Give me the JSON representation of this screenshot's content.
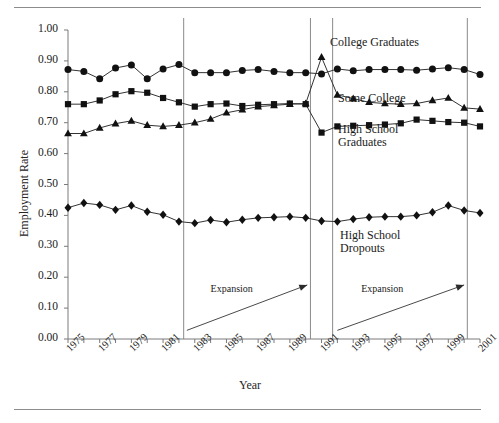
{
  "figure": {
    "has_top_rule": true,
    "has_bottom_rule": true,
    "rule_color": "#8c8c8c"
  },
  "chart_data": {
    "type": "line",
    "title": "",
    "subtitle": "",
    "xlabel": "Year",
    "ylabel": "Employment Rate",
    "xlim": [
      1975,
      2001
    ],
    "ylim": [
      0.0,
      1.0
    ],
    "grid": false,
    "legend_position": "inline-annotations",
    "marker_color": "#111111",
    "line_color": "#333333",
    "ytick_labels": [
      "0.00",
      "0.10",
      "0.20",
      "0.30",
      "0.40",
      "0.50",
      "0.60",
      "0.70",
      "0.80",
      "0.90",
      "1.00"
    ],
    "ytick_values": [
      0.0,
      0.1,
      0.2,
      0.3,
      0.4,
      0.5,
      0.6,
      0.7,
      0.8,
      0.9,
      1.0
    ],
    "xtick_labels": [
      "1975",
      "1977",
      "1979",
      "1981",
      "1983",
      "1985",
      "1987",
      "1989",
      "1991",
      "1993",
      "1995",
      "1997",
      "1999",
      "2001"
    ],
    "xtick_values": [
      1975,
      1977,
      1979,
      1981,
      1983,
      1985,
      1987,
      1989,
      1991,
      1993,
      1995,
      1997,
      1999,
      2001
    ],
    "x": [
      1975,
      1976,
      1977,
      1978,
      1979,
      1980,
      1981,
      1982,
      1983,
      1984,
      1985,
      1986,
      1987,
      1988,
      1989,
      1990,
      1991,
      1992,
      1993,
      1994,
      1995,
      1996,
      1997,
      1998,
      1999,
      2000,
      2001
    ],
    "series": [
      {
        "name": "College Graduates",
        "marker": "circle",
        "label_position": "top-right",
        "values": [
          0.872,
          0.866,
          0.842,
          0.877,
          0.887,
          0.842,
          0.874,
          0.888,
          0.862,
          0.862,
          0.862,
          0.869,
          0.872,
          0.866,
          0.862,
          0.862,
          0.858,
          0.874,
          0.868,
          0.872,
          0.872,
          0.872,
          0.87,
          0.874,
          0.878,
          0.872,
          0.856
        ]
      },
      {
        "name": "Some College",
        "marker": "triangle",
        "label_position": "middle-right",
        "values": [
          0.665,
          0.665,
          0.683,
          0.697,
          0.706,
          0.692,
          0.688,
          0.692,
          0.7,
          0.712,
          0.732,
          0.742,
          0.752,
          0.756,
          0.76,
          0.762,
          0.912,
          0.79,
          0.778,
          0.766,
          0.762,
          0.76,
          0.762,
          0.772,
          0.78,
          0.748,
          0.744
        ]
      },
      {
        "name": "High School Graduates",
        "marker": "square",
        "label_position": "lower-right",
        "values": [
          0.76,
          0.76,
          0.772,
          0.792,
          0.802,
          0.797,
          0.78,
          0.766,
          0.752,
          0.76,
          0.762,
          0.754,
          0.758,
          0.76,
          0.762,
          0.76,
          0.668,
          0.688,
          0.69,
          0.692,
          0.694,
          0.698,
          0.71,
          0.706,
          0.702,
          0.7,
          0.688
        ]
      },
      {
        "name": "High School Dropouts",
        "marker": "diamond",
        "label_position": "bottom-right",
        "values": [
          0.425,
          0.44,
          0.434,
          0.418,
          0.432,
          0.412,
          0.402,
          0.38,
          0.375,
          0.385,
          0.378,
          0.386,
          0.392,
          0.394,
          0.396,
          0.392,
          0.382,
          0.38,
          0.388,
          0.394,
          0.396,
          0.396,
          0.4,
          0.41,
          0.432,
          0.416,
          0.408
        ]
      }
    ],
    "vertical_lines": [
      {
        "year": 1982.3,
        "label": "recession-divider-1"
      },
      {
        "year": 1990.3,
        "label": "recession-divider-2"
      },
      {
        "year": 1991.7,
        "label": "recession-divider-3"
      },
      {
        "year": 2000.2,
        "label": "recession-divider-4"
      }
    ],
    "annotations": [
      {
        "text": "Expansion",
        "arrow_from": {
          "year": 1982.5,
          "value": 0.028
        },
        "arrow_to": {
          "year": 1990.1,
          "value": 0.175
        },
        "text_at": {
          "year": 1984.0,
          "value": 0.16
        }
      },
      {
        "text": "Expansion",
        "arrow_from": {
          "year": 1992.0,
          "value": 0.028
        },
        "arrow_to": {
          "year": 2000.0,
          "value": 0.175
        },
        "text_at": {
          "year": 1993.5,
          "value": 0.16
        }
      }
    ]
  }
}
